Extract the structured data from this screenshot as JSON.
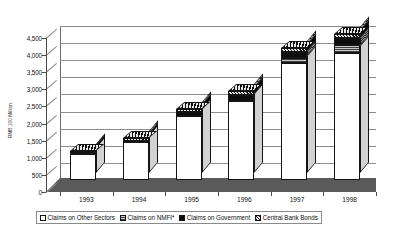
{
  "chart_data": {
    "type": "bar",
    "subtype": "stacked-column-3d",
    "title": "",
    "xlabel": "",
    "ylabel": "RMB 100 Million",
    "categories": [
      "1993",
      "1994",
      "1995",
      "1996",
      "1997",
      "1998"
    ],
    "ylim": [
      0,
      4500
    ],
    "ytick_values": [
      0,
      500,
      1000,
      1500,
      2000,
      2500,
      3000,
      3500,
      4000,
      4500
    ],
    "ytick_labels": [
      "0",
      "500",
      "1,000",
      "1,500",
      "2,000",
      "2,500",
      "3,000",
      "3,500",
      "4,000",
      "4,500"
    ],
    "grid": true,
    "legend_position": "bottom",
    "series": [
      {
        "name": "Claims on Other Sectors",
        "pattern": "white",
        "color": "#ffffff",
        "values": [
          760,
          1120,
          1870,
          2300,
          3420,
          3720
        ]
      },
      {
        "name": "Claims on NMFI*",
        "pattern": "gray-horizontal-lines",
        "color": "#9a9a9a",
        "values": [
          0,
          0,
          0,
          0,
          150,
          230
        ]
      },
      {
        "name": "Claims on Government",
        "pattern": "solid-black",
        "color": "#0d0d0d",
        "values": [
          20,
          30,
          110,
          170,
          180,
          200
        ]
      },
      {
        "name": "Central Bank Bonds",
        "pattern": "cross-hatch",
        "color": "#4a4a4a",
        "values": [
          70,
          80,
          90,
          130,
          110,
          130
        ]
      }
    ],
    "totals": [
      850,
      1230,
      2070,
      2600,
      3860,
      4280
    ],
    "footnote_marker": "*"
  },
  "legend": {
    "items": [
      {
        "label": "Claims on Other Sectors",
        "pattern": "white"
      },
      {
        "label": "Claims on NMFI*",
        "pattern": "gray"
      },
      {
        "label": "Claims on Government",
        "pattern": "black"
      },
      {
        "label": "Central Bank Bonds",
        "pattern": "hatch"
      }
    ]
  }
}
